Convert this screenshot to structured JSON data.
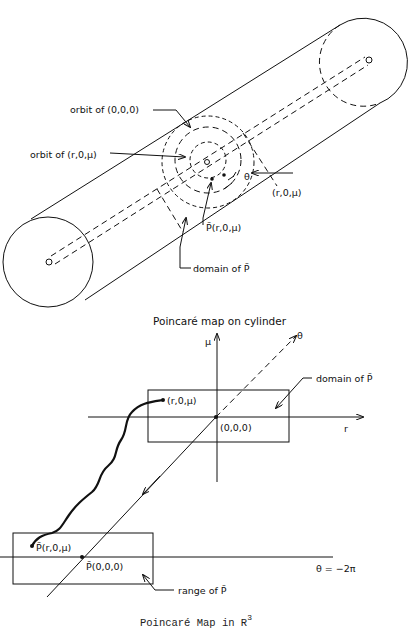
{
  "figure": {
    "cylinder_view": {
      "title": "Poincaré map on cylinder",
      "labels": {
        "orbit_origin": "orbit of (0,0,0)",
        "orbit_point": "orbit of (r,0,μ)",
        "point": "(r,0,μ)",
        "image_point": "P̃(r,0,μ)",
        "domain": "domain of P̃",
        "theta": "θ",
        "r": "r"
      }
    },
    "r3_view": {
      "caption": "Poincaré Map in R",
      "caption_superscript": "3",
      "axes": {
        "mu": "μ",
        "theta": "θ",
        "r": "r"
      },
      "labels": {
        "domain": "domain of P̃",
        "range": "range of P̃",
        "point": "(r,0,μ)",
        "origin": "(0,0,0)",
        "image_point": "P̃(r,0,μ)",
        "image_origin": "P̃(0,0,0)",
        "plane_eq": "θ = −2π"
      }
    },
    "colors": {
      "ink": "#111111",
      "background": "#ffffff"
    }
  }
}
